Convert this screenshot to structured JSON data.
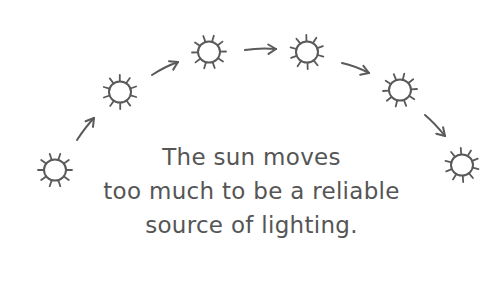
{
  "illustration": {
    "stroke_color": "#5a5a5a",
    "background": "#ffffff",
    "suns": [
      {
        "name": "sun-1",
        "cx": 55,
        "cy": 170
      },
      {
        "name": "sun-2",
        "cx": 120,
        "cy": 92
      },
      {
        "name": "sun-3",
        "cx": 209,
        "cy": 52
      },
      {
        "name": "sun-4",
        "cx": 307,
        "cy": 52
      },
      {
        "name": "sun-5",
        "cx": 400,
        "cy": 90
      },
      {
        "name": "sun-6",
        "cx": 462,
        "cy": 165
      }
    ],
    "arrows": [
      {
        "name": "arrow-1",
        "from": [
          77,
          140
        ],
        "to": [
          94,
          118
        ]
      },
      {
        "name": "arrow-2",
        "from": [
          152,
          75
        ],
        "to": [
          178,
          62
        ]
      },
      {
        "name": "arrow-3",
        "from": [
          245,
          50
        ],
        "to": [
          276,
          49
        ]
      },
      {
        "name": "arrow-4",
        "from": [
          342,
          63
        ],
        "to": [
          369,
          73
        ]
      },
      {
        "name": "arrow-5",
        "from": [
          425,
          115
        ],
        "to": [
          445,
          136
        ]
      }
    ]
  },
  "caption": {
    "lines": [
      "The sun moves",
      "too much to be a reliable",
      "source of lighting."
    ],
    "color": "#555555"
  }
}
